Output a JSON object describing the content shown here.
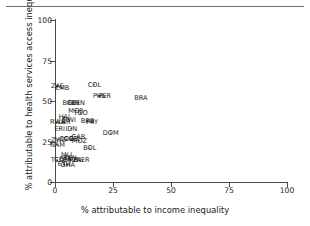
{
  "figure": {
    "top_rule": true,
    "ghost_text": ""
  },
  "chart_data": {
    "type": "scatter",
    "title": "",
    "xlabel": "% attributable to income inequality",
    "ylabel": "% attributable to health services access inequality",
    "xlim": [
      0,
      100
    ],
    "ylim": [
      0,
      100
    ],
    "xticks": [
      0,
      25,
      50,
      75,
      100
    ],
    "yticks": [
      0,
      25,
      50,
      75,
      100
    ],
    "xtick_labels": [
      "0",
      "25",
      "50",
      "75",
      "100"
    ],
    "ytick_labels": [
      "0",
      "25",
      "50",
      "75",
      "100"
    ],
    "grid": false,
    "legend": "none",
    "point_label_field": "country iso3 code",
    "points": [
      {
        "label": "ZAF",
        "x": 1.0,
        "y": 59.0
      },
      {
        "label": "ZMB",
        "x": 3.0,
        "y": 58.0
      },
      {
        "label": "COL",
        "x": 17.0,
        "y": 60.0
      },
      {
        "label": "PHL",
        "x": 19.0,
        "y": 53.0
      },
      {
        "label": "PER",
        "x": 21.5,
        "y": 53.0
      },
      {
        "label": "BRA",
        "x": 37.0,
        "y": 52.0
      },
      {
        "label": "BOL",
        "x": 6.0,
        "y": 49.0
      },
      {
        "label": "GIN",
        "x": 8.0,
        "y": 49.0
      },
      {
        "label": "BEN",
        "x": 10.0,
        "y": 49.0
      },
      {
        "label": "MOR",
        "x": 9.0,
        "y": 44.0
      },
      {
        "label": "TGO",
        "x": 11.0,
        "y": 42.5
      },
      {
        "label": "HAI",
        "x": 4.0,
        "y": 40.0
      },
      {
        "label": "MWI",
        "x": 6.0,
        "y": 38.5
      },
      {
        "label": "RWA",
        "x": 1.0,
        "y": 37.0
      },
      {
        "label": "LBR",
        "x": 4.0,
        "y": 37.0
      },
      {
        "label": "BRB",
        "x": 14.0,
        "y": 37.5
      },
      {
        "label": "PRY",
        "x": 16.0,
        "y": 37.0
      },
      {
        "label": "ERI",
        "x": 2.0,
        "y": 33.0
      },
      {
        "label": "IDN",
        "x": 7.0,
        "y": 33.0
      },
      {
        "label": "DOM",
        "x": 24.0,
        "y": 30.0
      },
      {
        "label": "ZWE",
        "x": 1.5,
        "y": 26.0
      },
      {
        "label": "COG",
        "x": 5.0,
        "y": 26.5
      },
      {
        "label": "COD",
        "x": 7.0,
        "y": 26.5
      },
      {
        "label": "GAB",
        "x": 10.0,
        "y": 28.0
      },
      {
        "label": "MOZ",
        "x": 10.5,
        "y": 25.5
      },
      {
        "label": "NAM",
        "x": 1.0,
        "y": 23.0
      },
      {
        "label": "BOL2",
        "x": 15.0,
        "y": 21.0
      },
      {
        "label": "MLI",
        "x": 5.0,
        "y": 16.5
      },
      {
        "label": "SEN",
        "x": 6.5,
        "y": 15.0
      },
      {
        "label": "TCD",
        "x": 1.0,
        "y": 13.5
      },
      {
        "label": "BFA",
        "x": 4.5,
        "y": 14.0
      },
      {
        "label": "GMB",
        "x": 6.5,
        "y": 13.5
      },
      {
        "label": "TZA",
        "x": 8.5,
        "y": 13.5
      },
      {
        "label": "NER",
        "x": 12.0,
        "y": 13.5
      },
      {
        "label": "ETH",
        "x": 4.0,
        "y": 11.0
      },
      {
        "label": "GHA",
        "x": 5.5,
        "y": 10.5
      }
    ]
  }
}
